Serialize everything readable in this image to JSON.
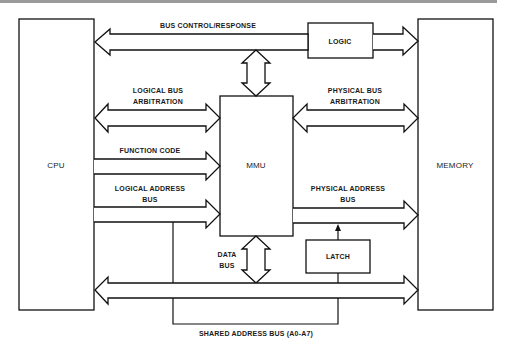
{
  "diagram": {
    "blocks": {
      "cpu": "CPU",
      "memory": "MEMORY",
      "mmu": "MMU",
      "logic": "LOGIC",
      "latch": "LATCH"
    },
    "buses": {
      "bus_control": "BUS CONTROL/RESPONSE",
      "logical_arb_1": "LOGICAL BUS",
      "logical_arb_2": "ARBITRATION",
      "physical_arb_1": "PHYSICAL BUS",
      "physical_arb_2": "ARBITRATION",
      "function_code": "FUNCTION CODE",
      "logical_addr_1": "LOGICAL ADDRESS",
      "logical_addr_2": "BUS",
      "physical_addr_1": "PHYSICAL ADDRESS",
      "physical_addr_2": "BUS",
      "data_bus_1": "DATA",
      "data_bus_2": "BUS",
      "shared_addr": "SHARED ADDRESS BUS (A0-A7)"
    },
    "connections": [
      {
        "from": "CPU",
        "to": "LOGIC",
        "label": "BUS CONTROL/RESPONSE",
        "direction": "bidirectional"
      },
      {
        "from": "LOGIC",
        "to": "MEMORY",
        "direction": "to"
      },
      {
        "from": "BUS CONTROL/RESPONSE",
        "to": "MMU",
        "direction": "bidirectional"
      },
      {
        "from": "CPU",
        "to": "MMU",
        "label": "LOGICAL BUS ARBITRATION",
        "direction": "bidirectional"
      },
      {
        "from": "MMU",
        "to": "MEMORY",
        "label": "PHYSICAL BUS ARBITRATION",
        "direction": "bidirectional"
      },
      {
        "from": "CPU",
        "to": "MMU",
        "label": "FUNCTION CODE",
        "direction": "to"
      },
      {
        "from": "CPU",
        "to": "MMU",
        "label": "LOGICAL ADDRESS BUS",
        "direction": "to"
      },
      {
        "from": "MMU",
        "to": "MEMORY",
        "label": "PHYSICAL ADDRESS BUS",
        "direction": "to"
      },
      {
        "from": "LATCH",
        "to": "PHYSICAL ADDRESS BUS",
        "direction": "to"
      },
      {
        "from": "MMU",
        "to": "DATA BUS",
        "label": "DATA BUS",
        "direction": "bidirectional"
      },
      {
        "from": "CPU",
        "to": "MEMORY",
        "label": "DATA BUS",
        "direction": "bidirectional"
      },
      {
        "from": "LOGICAL ADDRESS BUS",
        "to": "LATCH",
        "label": "SHARED ADDRESS BUS (A0-A7)",
        "direction": "line"
      }
    ]
  }
}
